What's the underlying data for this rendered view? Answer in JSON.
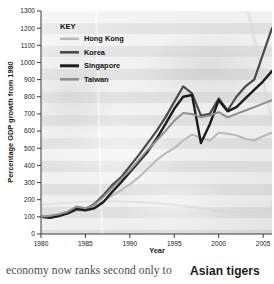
{
  "figure": {
    "plot_bg_note": "grayscale photographic banded background"
  },
  "caption": {
    "body_text": "economy now ranks second only to",
    "section_heading": "Asian tigers"
  },
  "legend": {
    "title": "KEY",
    "entries": [
      {
        "label": "Hong Kong",
        "color": "#b9b9b9",
        "width": 2.6
      },
      {
        "label": "Korea",
        "color": "#4a4a4a",
        "width": 2.6
      },
      {
        "label": "Singapore",
        "color": "#1c1c1c",
        "width": 3.0
      },
      {
        "label": "Taiwan",
        "color": "#8f8f8f",
        "width": 2.6
      }
    ]
  },
  "chart_data": {
    "type": "line",
    "title": "",
    "xlabel": "Year",
    "ylabel": "Percentage GDP growth from 1980",
    "xlim": [
      1980,
      2006
    ],
    "ylim": [
      0,
      1300
    ],
    "xticks": [
      1980,
      1985,
      1990,
      1995,
      2000,
      2005
    ],
    "xticklabels": [
      "1980",
      "1985",
      "1990",
      "1995",
      "2000",
      "2005"
    ],
    "yticks": [
      0,
      100,
      200,
      300,
      400,
      500,
      600,
      700,
      800,
      900,
      1000,
      1100,
      1200,
      1300
    ],
    "yticklabels": [
      "0",
      "100",
      "200",
      "300",
      "400",
      "500",
      "600",
      "700",
      "800",
      "900",
      "1000",
      "1100",
      "1200",
      "1300"
    ],
    "grid": false,
    "legend_position": "upper-left-inside",
    "x": [
      1980,
      1981,
      1982,
      1983,
      1984,
      1985,
      1986,
      1987,
      1988,
      1989,
      1990,
      1991,
      1992,
      1993,
      1994,
      1995,
      1996,
      1997,
      1998,
      1999,
      2000,
      2001,
      2002,
      2003,
      2004,
      2005,
      2006
    ],
    "series": [
      {
        "name": "Hong Kong",
        "color": "#b9b9b9",
        "width": 2.0,
        "values": [
          100,
          108,
          112,
          118,
          135,
          140,
          155,
          190,
          225,
          255,
          290,
          330,
          380,
          430,
          470,
          500,
          545,
          580,
          560,
          545,
          590,
          585,
          575,
          555,
          545,
          570,
          590
        ]
      },
      {
        "name": "Korea",
        "color": "#4a4a4a",
        "width": 2.2,
        "values": [
          100,
          98,
          110,
          125,
          150,
          145,
          175,
          225,
          285,
          330,
          395,
          460,
          530,
          600,
          680,
          770,
          860,
          820,
          690,
          700,
          790,
          720,
          800,
          860,
          900,
          1050,
          1200
        ]
      },
      {
        "name": "Singapore",
        "color": "#1c1c1c",
        "width": 2.4,
        "values": [
          100,
          95,
          105,
          120,
          145,
          138,
          150,
          185,
          245,
          300,
          360,
          420,
          480,
          555,
          640,
          730,
          800,
          810,
          530,
          640,
          780,
          715,
          740,
          790,
          840,
          890,
          950
        ]
      },
      {
        "name": "Taiwan",
        "color": "#8f8f8f",
        "width": 2.0,
        "values": [
          100,
          105,
          115,
          130,
          160,
          150,
          170,
          215,
          270,
          320,
          370,
          430,
          490,
          545,
          600,
          660,
          705,
          700,
          680,
          690,
          710,
          680,
          700,
          720,
          740,
          760,
          780
        ]
      }
    ]
  }
}
